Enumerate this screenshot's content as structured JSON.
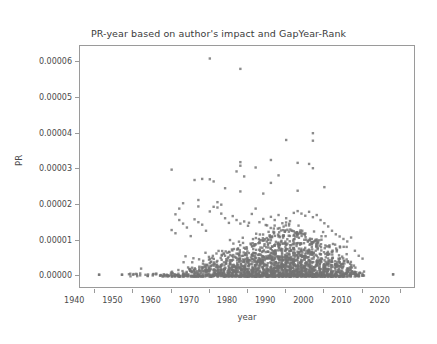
{
  "chart_data": {
    "type": "scatter",
    "title": "PR-year based on author's impact and GapYear-Rank",
    "xlabel": "year",
    "ylabel": "PR",
    "xlim": [
      1936,
      2024
    ],
    "ylim": [
      -3.5e-06,
      6.45e-05
    ],
    "xticks": [
      1940,
      1950,
      1960,
      1970,
      1980,
      1990,
      2000,
      2010,
      2020
    ],
    "xtick_labels": [
      "1940",
      "1950",
      "1960",
      "1970",
      "1980",
      "1990",
      "2000",
      "2010",
      "2020"
    ],
    "yticks": [
      0.0,
      1e-05,
      2e-05,
      3e-05,
      4e-05,
      5e-05,
      6e-05
    ],
    "ytick_labels": [
      "0.00000",
      "0.00001",
      "0.00002",
      "0.00003",
      "0.00004",
      "0.00005",
      "0.00006"
    ],
    "grid": false,
    "legend": false,
    "marker": "square",
    "marker_size": 2.4,
    "marker_color": "#737373",
    "point_count_approx": 2600,
    "notable_points": [
      {
        "x": 1970,
        "y": 6.1e-05
      },
      {
        "x": 1978,
        "y": 5.81e-05
      },
      {
        "x": 1997,
        "y": 4.01e-05
      },
      {
        "x": 1997,
        "y": 3.8e-05
      },
      {
        "x": 1990,
        "y": 3.82e-05
      },
      {
        "x": 1986,
        "y": 3.26e-05
      },
      {
        "x": 1978,
        "y": 3.2e-05
      },
      {
        "x": 1993,
        "y": 3.18e-05
      },
      {
        "x": 1996,
        "y": 3.15e-05
      },
      {
        "x": 1978,
        "y": 3.1e-05
      },
      {
        "x": 1982,
        "y": 3.05e-05
      },
      {
        "x": 1997,
        "y": 3.03e-05
      },
      {
        "x": 1960,
        "y": 2.99e-05
      },
      {
        "x": 1977,
        "y": 2.94e-05
      },
      {
        "x": 1988,
        "y": 2.83e-05
      },
      {
        "x": 1979,
        "y": 2.8e-05
      },
      {
        "x": 1968,
        "y": 2.73e-05
      },
      {
        "x": 1970,
        "y": 2.72e-05
      },
      {
        "x": 1966,
        "y": 2.7e-05
      },
      {
        "x": 1971,
        "y": 2.66e-05
      },
      {
        "x": 1986,
        "y": 2.62e-05
      },
      {
        "x": 2000,
        "y": 2.5e-05
      },
      {
        "x": 1974,
        "y": 2.47e-05
      },
      {
        "x": 1993,
        "y": 2.4e-05
      },
      {
        "x": 1978,
        "y": 2.38e-05
      },
      {
        "x": 1984,
        "y": 2.32e-05
      },
      {
        "x": 1967,
        "y": 2.14e-05
      },
      {
        "x": 1963,
        "y": 2.05e-05
      },
      {
        "x": 1972,
        "y": 2.08e-05
      },
      {
        "x": 1973,
        "y": 2.01e-05
      },
      {
        "x": 1941,
        "y": 5e-07
      },
      {
        "x": 1947,
        "y": 5e-07
      },
      {
        "x": 2018,
        "y": 6e-07
      }
    ],
    "distribution_notes": {
      "dense_band_years": [
        1958,
        2010
      ],
      "dense_band_y_max": 1.2e-05,
      "peak_density_years": [
        1985,
        1998
      ],
      "sparse_left_years": [
        1941,
        1957
      ],
      "isolated_right_year": 2018
    }
  }
}
